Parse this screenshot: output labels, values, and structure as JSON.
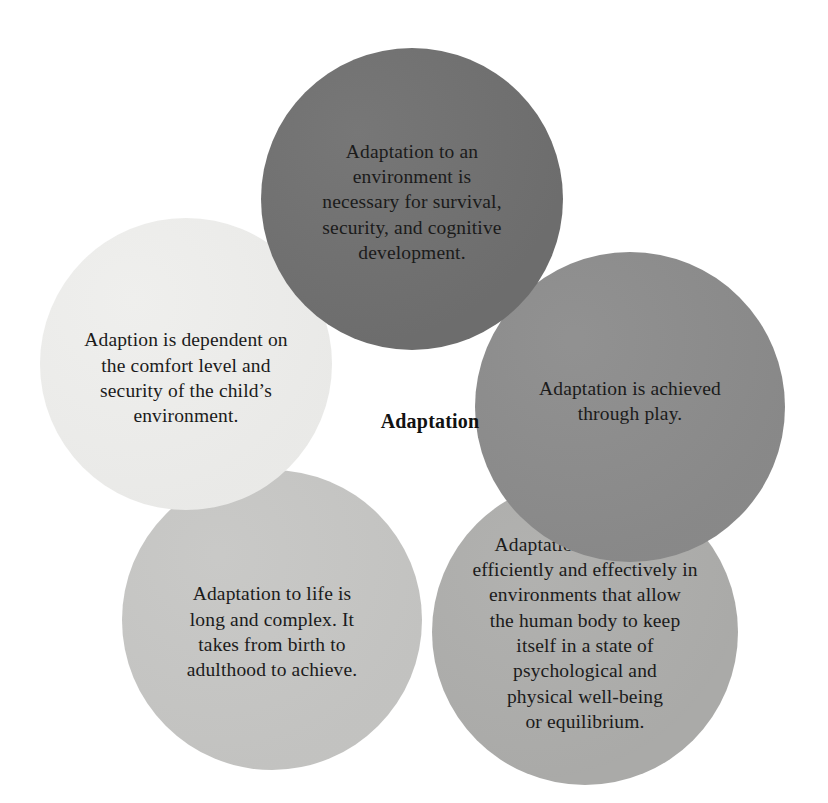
{
  "diagram": {
    "center_label": "Adaptation",
    "background_color": "#ffffff",
    "text_color": "#1b1b1b",
    "bubbles": [
      {
        "id": "top",
        "position": "top",
        "text": "Adaptation to an\nenvironment is\nnecessary for survival,\nsecurity, and cognitive\ndevelopment.",
        "fill_color": "#6f6f6f"
      },
      {
        "id": "left",
        "position": "left",
        "text": "Adaption is dependent on\nthe comfort level and\nsecurity of the child’s\nenvironment.",
        "fill_color": "#eeeeec"
      },
      {
        "id": "right",
        "position": "right",
        "text": "Adaptation is achieved\nthrough play.",
        "fill_color": "#8b8b8b"
      },
      {
        "id": "bottomleft",
        "position": "bottom-left",
        "text": "Adaptation to life is\nlong and complex. It\ntakes from birth to\nadulthood to achieve.",
        "fill_color": "#c6c6c4"
      },
      {
        "id": "bottomright",
        "position": "bottom-right",
        "text": "Adaptation takes place\nefficiently and effectively in\nenvironments that allow\nthe human body to keep\nitself in a state of\npsychological and\nphysical well-being\nor equilibrium.",
        "fill_color": "#adadab"
      }
    ]
  }
}
